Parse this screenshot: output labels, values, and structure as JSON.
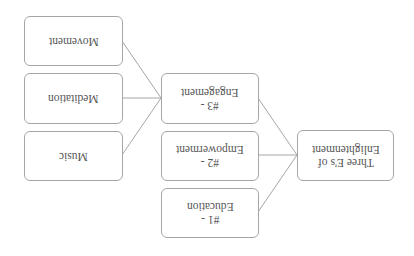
{
  "diagram": {
    "orientation": "rotated 180 degrees",
    "root": {
      "id": "root",
      "label": "Three E's of\nEnlightenment"
    },
    "level1": [
      {
        "id": "e1",
        "label": "#1 -\nEducation"
      },
      {
        "id": "e2",
        "label": "#2 -\nEmpowerment"
      },
      {
        "id": "e3",
        "label": "#3 -\nEngagement"
      }
    ],
    "level2": [
      {
        "id": "music",
        "parent": "e3",
        "label": "Music"
      },
      {
        "id": "meditation",
        "parent": "e3",
        "label": "Meditation"
      },
      {
        "id": "movement",
        "parent": "e3",
        "label": "Movement"
      }
    ],
    "colors": {
      "border": "#a6a6a6",
      "connector": "#a6a6a6",
      "text": "#555555",
      "background": "#ffffff"
    }
  }
}
